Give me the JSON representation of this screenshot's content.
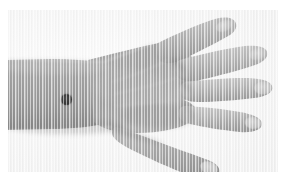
{
  "figure": {
    "caption": "",
    "background_color": "#ffffff",
    "plate_color": "#f2f2f2",
    "color_mode": "grayscale"
  },
  "subject": {
    "label": "hand",
    "view": "dorsal",
    "side": "left",
    "orientation": "forearm entering from left edge, fingers spread toward right"
  },
  "tones": {
    "skin_mid": "#9b9b9b",
    "skin_light": "#bcbcbc",
    "skin_highlight": "#cfcfcf",
    "skin_shadow": "#8a8a8a",
    "skin_deep_shadow": "#7c7c7c",
    "nail": "#c9c9c9",
    "background": "#f2f2f2",
    "marker": "#333333"
  },
  "parts": [
    {
      "name": "forearm",
      "label": "forearm"
    },
    {
      "name": "wrist",
      "label": "wrist"
    },
    {
      "name": "dorsum",
      "label": "back of hand"
    },
    {
      "name": "index-finger",
      "label": "index finger"
    },
    {
      "name": "middle-finger",
      "label": "middle finger"
    },
    {
      "name": "ring-finger",
      "label": "ring finger"
    },
    {
      "name": "little-finger",
      "label": "little finger"
    },
    {
      "name": "thumb",
      "label": "thumb"
    }
  ],
  "marker": {
    "label": "skin lesion marker",
    "shape": "filled circle",
    "color": "#333333",
    "center_x_px": 66,
    "center_y_px": 99,
    "diameter_px": 11,
    "location": "dorsal wrist"
  },
  "plate_geometry": {
    "left_px": 8,
    "top_px": 10,
    "width_px": 270,
    "height_px": 162
  }
}
